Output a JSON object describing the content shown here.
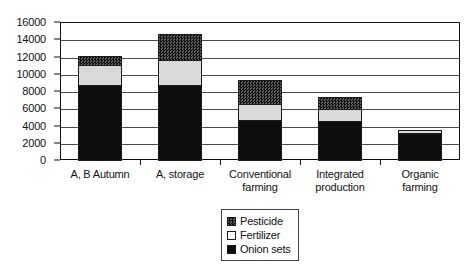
{
  "chart_data": {
    "type": "bar",
    "stacked": true,
    "title": "",
    "subtitle": "",
    "xlabel": "",
    "ylabel": "",
    "categories": [
      "A, B Autumn",
      "A, storage",
      "Conventional farming",
      "Integrated production",
      "Organic farming"
    ],
    "category_lines": [
      [
        "A, B Autumn"
      ],
      [
        "A, storage"
      ],
      [
        "Conventional",
        "farming"
      ],
      [
        "Integrated",
        "production"
      ],
      [
        "Organic",
        "farming"
      ]
    ],
    "series": [
      {
        "name": "Onion sets",
        "values": [
          8800,
          8800,
          4700,
          4600,
          3300
        ]
      },
      {
        "name": "Fertilizer",
        "values": [
          2500,
          3000,
          2000,
          1500,
          400
        ]
      },
      {
        "name": "Pesticide",
        "values": [
          1100,
          3200,
          2900,
          1500,
          0
        ]
      }
    ],
    "totals": [
      12400,
      15000,
      9600,
      7600,
      3700
    ],
    "ylim": [
      0,
      16000
    ],
    "ytick_values": [
      0,
      2000,
      4000,
      6000,
      8000,
      10000,
      12000,
      14000,
      16000
    ],
    "ytick_labels": [
      "0",
      "2000",
      "4000",
      "6000",
      "8000",
      "10000",
      "12000",
      "14000",
      "16000"
    ],
    "grid": true,
    "grid_axis": "y",
    "legend_position": "bottom-center",
    "legend": [
      {
        "label": "Pesticide",
        "swatch": "pesticide-swatch",
        "color": "#2e2e2e"
      },
      {
        "label": "Fertilizer",
        "swatch": "fertilizer-swatch",
        "color": "#ffffff"
      },
      {
        "label": "Onion sets",
        "swatch": "onion-sets-swatch",
        "color": "#0d0d0d"
      }
    ],
    "colors": {
      "onion_sets": "#0d0d0d",
      "fertilizer": "#d9d9d9",
      "pesticide": "#2e2e2e",
      "axis": "#111111",
      "gridline": "#4a4a4a",
      "background": "#ffffff"
    }
  }
}
